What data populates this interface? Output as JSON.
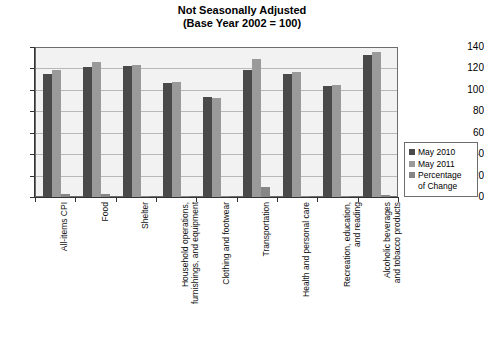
{
  "chart_data": {
    "type": "bar",
    "title": "Not Seasonally Adjusted",
    "subtitle": "(Base Year 2002 = 100)",
    "xlabel": "",
    "ylabel": "",
    "ylim": [
      0,
      140
    ],
    "yticks": [
      0,
      20,
      40,
      60,
      80,
      100,
      120,
      140
    ],
    "grid": true,
    "legend_position": "right",
    "categories": [
      "All-items CPI",
      "Food",
      "Shelter",
      "Household operations,\nfurnishings, and equipment",
      "Clothing and footwear",
      "Transportation",
      "Health and personal care",
      "Recreation, education,\nand reading",
      "Alcoholic beverages\nand tobacco products"
    ],
    "series": [
      {
        "name": "May 2010",
        "color": "#4a4a4a",
        "values": [
          116,
          122,
          123,
          107,
          94,
          119,
          116,
          104,
          133
        ]
      },
      {
        "name": "May 2011",
        "color": "#9a9a9a",
        "values": [
          119,
          127,
          124,
          108,
          93,
          130,
          117,
          105,
          136
        ]
      },
      {
        "name": "Percentage of Change",
        "color": "#868686",
        "values": [
          3,
          3,
          1,
          1,
          1,
          9,
          1,
          1,
          2
        ]
      }
    ]
  },
  "legend": {
    "items": [
      {
        "label": "May 2010"
      },
      {
        "label": "May 2011"
      },
      {
        "label": "Percentage\nof Change"
      }
    ]
  }
}
